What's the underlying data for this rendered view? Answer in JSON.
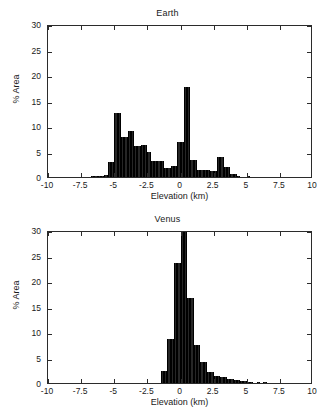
{
  "figure": {
    "width": 335,
    "height": 411,
    "background": "#ffffff",
    "bar_color": "#262626",
    "axis_color": "#2b2b2b"
  },
  "chart_data": [
    {
      "type": "bar",
      "id": "earth",
      "title": "Earth",
      "xlabel": "Elevation (km)",
      "ylabel": "% Area",
      "xlim": [
        -10,
        10
      ],
      "ylim": [
        0,
        30
      ],
      "xticks": [
        -10,
        -7.5,
        -5,
        -2.5,
        0,
        2.5,
        5,
        7.5,
        10
      ],
      "xticklabels": [
        "-10",
        "-7.5",
        "-5",
        "-2.5",
        "0",
        "2.5",
        "5",
        "7.5",
        "10"
      ],
      "yticks": [
        0,
        5,
        10,
        15,
        20,
        25,
        30
      ],
      "yticklabels": [
        "0",
        "5",
        "10",
        "15",
        "20",
        "25",
        "30"
      ],
      "grid": false,
      "legend": false,
      "bin_width": 0.25,
      "bin_centers": [
        -7.625,
        -7.375,
        -7.125,
        -6.875,
        -6.625,
        -6.375,
        -6.125,
        -5.875,
        -5.625,
        -5.375,
        -5.125,
        -4.875,
        -4.625,
        -4.375,
        -4.125,
        -3.875,
        -3.625,
        -3.375,
        -3.125,
        -2.875,
        -2.625,
        -2.375,
        -2.125,
        -1.875,
        -1.625,
        -1.375,
        -1.125,
        -0.875,
        -0.625,
        -0.375,
        -0.125,
        0.125,
        0.375,
        0.625,
        0.875,
        1.125,
        1.375,
        1.625,
        1.875,
        2.125,
        2.375,
        2.625,
        2.875,
        3.125,
        3.375,
        3.625,
        3.875,
        4.125,
        4.375,
        4.625,
        5.125,
        5.625,
        6.375,
        7.375,
        8.125,
        8.625
      ],
      "values": [
        0.05,
        0.05,
        0.08,
        0.1,
        0.12,
        0.15,
        0.18,
        0.25,
        0.35,
        3.0,
        3.0,
        12.6,
        12.6,
        7.9,
        7.9,
        9.0,
        9.0,
        6.0,
        6.0,
        6.3,
        6.3,
        5.0,
        3.1,
        3.1,
        3.2,
        3.2,
        1.8,
        1.8,
        2.1,
        2.1,
        6.8,
        6.8,
        17.6,
        17.6,
        3.3,
        3.3,
        1.3,
        1.3,
        1.3,
        1.3,
        1.1,
        1.1,
        4.0,
        4.0,
        2.0,
        2.0,
        0.6,
        0.6,
        0.15,
        0.1,
        0.12,
        0.05,
        0.04,
        0.04,
        0.03,
        0.03
      ]
    },
    {
      "type": "bar",
      "id": "venus",
      "title": "Venus",
      "xlabel": "Elevation (km)",
      "ylabel": "% Area",
      "xlim": [
        -10,
        10
      ],
      "ylim": [
        0,
        30
      ],
      "xticks": [
        -10,
        -7.5,
        -5,
        -2.5,
        0,
        2.5,
        5,
        7.5,
        10
      ],
      "xticklabels": [
        "-10",
        "-7.5",
        "-5",
        "-2.5",
        "0",
        "2.5",
        "5",
        "7.5",
        "10"
      ],
      "yticks": [
        0,
        5,
        10,
        15,
        20,
        25,
        30
      ],
      "yticklabels": [
        "0",
        "5",
        "10",
        "15",
        "20",
        "25",
        "30"
      ],
      "grid": false,
      "legend": false,
      "bin_width": 0.25,
      "bin_centers": [
        -1.375,
        -1.125,
        -0.875,
        -0.625,
        -0.375,
        -0.125,
        0.125,
        0.375,
        0.625,
        0.875,
        1.125,
        1.375,
        1.625,
        1.875,
        2.125,
        2.375,
        2.625,
        2.875,
        3.125,
        3.375,
        3.625,
        3.875,
        4.125,
        4.375,
        4.625,
        4.875,
        5.125,
        5.375,
        5.875,
        6.375,
        6.875,
        7.375,
        7.875,
        8.375,
        8.875
      ],
      "values": [
        2.3,
        2.3,
        8.7,
        8.7,
        23.6,
        23.6,
        29.6,
        29.6,
        16.6,
        16.6,
        7.4,
        7.4,
        4.1,
        4.1,
        2.1,
        2.1,
        1.4,
        1.4,
        1.1,
        1.1,
        0.7,
        0.7,
        0.55,
        0.55,
        0.3,
        0.3,
        0.2,
        0.2,
        0.15,
        0.12,
        0.1,
        0.08,
        0.07,
        0.06,
        0.05
      ]
    }
  ]
}
